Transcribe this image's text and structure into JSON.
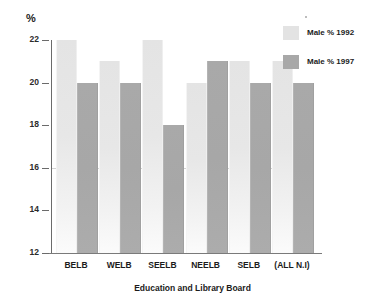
{
  "chart_data": {
    "type": "bar",
    "title": "",
    "xlabel": "Education and Library Board",
    "ylabel": "%",
    "ylim": [
      12,
      22
    ],
    "yticks": [
      12,
      14,
      16,
      18,
      20,
      22
    ],
    "grid": false,
    "legend_position": "right",
    "categories": [
      "BELB",
      "WELB",
      "SEELB",
      "NEELB",
      "SELB",
      "(ALL N.I)"
    ],
    "series": [
      {
        "name": "Male % 1992",
        "color": "#e3e3e3",
        "values": [
          22,
          21,
          22,
          20,
          21,
          21
        ]
      },
      {
        "name": "Male % 1997",
        "color": "#a8a8a8",
        "values": [
          20,
          20,
          18,
          21,
          20,
          20
        ]
      }
    ]
  },
  "axis": {
    "unit_label": "%",
    "tick_labels": [
      "22",
      "20",
      "18",
      "16",
      "14",
      "12"
    ],
    "x_title": "Education and Library Board"
  },
  "legend": {
    "items": [
      {
        "label": "Male % 1992"
      },
      {
        "label": "Male % 1997"
      }
    ]
  }
}
